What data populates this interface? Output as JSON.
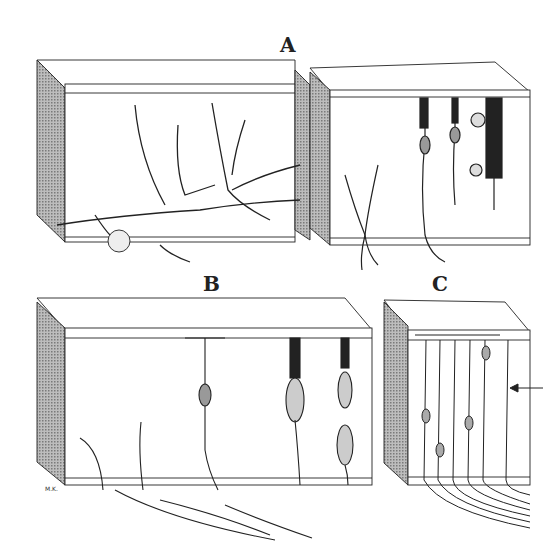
{
  "figure": {
    "panels": [
      {
        "label": "A",
        "description": "Two tissue blocks with branching fibers and cells"
      },
      {
        "label": "B",
        "description": "Tissue block with cells spanning layers"
      },
      {
        "label": "C",
        "description": "Tissue block with parallel vertical fibers and arrow"
      }
    ],
    "signature": "M.K."
  },
  "colors": {
    "ink": "#222222",
    "shade": "#9a9a9a",
    "background": "#ffffff"
  }
}
